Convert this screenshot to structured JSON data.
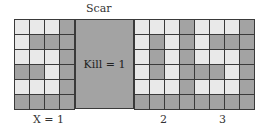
{
  "scar": {
    "title": "Scar",
    "kill_label": "Kill = 1"
  },
  "colors": {
    "light_cell": "#e9e9e9",
    "dark_cell": "#a3a3a3",
    "grid_line": "#3a3a3a"
  },
  "grids": {
    "left": {
      "label": "X = 1",
      "cells": [
        [
          "L",
          "L",
          "L",
          "D"
        ],
        [
          "L",
          "D",
          "D",
          "D"
        ],
        [
          "L",
          "L",
          "L",
          "D"
        ],
        [
          "D",
          "D",
          "L",
          "D"
        ],
        [
          "L",
          "L",
          "L",
          "D"
        ],
        [
          "D",
          "D",
          "D",
          "D"
        ]
      ]
    },
    "right": {
      "labels": [
        "2",
        "3"
      ],
      "cells": [
        [
          "L",
          "L",
          "L",
          "D",
          "L",
          "L",
          "L",
          "D"
        ],
        [
          "L",
          "D",
          "L",
          "D",
          "L",
          "D",
          "D",
          "D"
        ],
        [
          "L",
          "D",
          "L",
          "D",
          "L",
          "L",
          "L",
          "D"
        ],
        [
          "L",
          "D",
          "L",
          "D",
          "D",
          "D",
          "L",
          "D"
        ],
        [
          "L",
          "L",
          "L",
          "D",
          "L",
          "L",
          "L",
          "D"
        ],
        [
          "D",
          "D",
          "D",
          "D",
          "D",
          "D",
          "D",
          "D"
        ]
      ]
    }
  }
}
